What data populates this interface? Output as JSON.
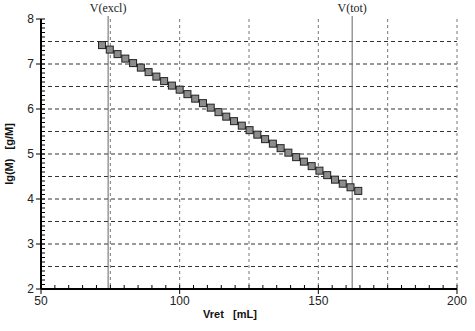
{
  "chart_data": {
    "type": "scatter",
    "title": "",
    "xlabel": "Vret   [mL]",
    "ylabel": "lg(M)   [g/M]",
    "xlim": [
      50,
      200
    ],
    "ylim": [
      2,
      8
    ],
    "x_ticks": [
      50,
      100,
      150,
      200
    ],
    "x_tick_labels": [
      "50",
      "100",
      "150",
      "200"
    ],
    "y_ticks": [
      2,
      3,
      4,
      5,
      6,
      7,
      8
    ],
    "y_tick_labels": [
      "2",
      "3",
      "4",
      "5",
      "6",
      "7",
      "8"
    ],
    "grid": {
      "horizontal_every": 0.5,
      "vertical_every": 25,
      "style": "dashed"
    },
    "reference_lines": [
      {
        "label": "V(excl)",
        "x": 74.2
      },
      {
        "label": "V(tot)",
        "x": 162.2
      }
    ],
    "series": [
      {
        "name": "calibration",
        "marker": "square",
        "line": true,
        "x": [
          72.0,
          74.8,
          77.6,
          80.4,
          83.2,
          86.0,
          88.8,
          91.6,
          94.4,
          97.2,
          100.0,
          102.8,
          105.6,
          108.4,
          111.2,
          114.0,
          116.8,
          119.6,
          122.4,
          125.2,
          128.0,
          130.8,
          133.6,
          136.4,
          139.2,
          142.0,
          144.8,
          147.6,
          150.4,
          153.2,
          156.0,
          158.8,
          161.6,
          164.4
        ],
        "y": [
          7.42,
          7.32,
          7.22,
          7.12,
          7.02,
          6.92,
          6.82,
          6.72,
          6.62,
          6.52,
          6.43,
          6.33,
          6.23,
          6.13,
          6.03,
          5.93,
          5.83,
          5.73,
          5.63,
          5.53,
          5.43,
          5.33,
          5.23,
          5.13,
          5.03,
          4.93,
          4.83,
          4.73,
          4.63,
          4.53,
          4.43,
          4.34,
          4.26,
          4.18
        ]
      }
    ]
  }
}
